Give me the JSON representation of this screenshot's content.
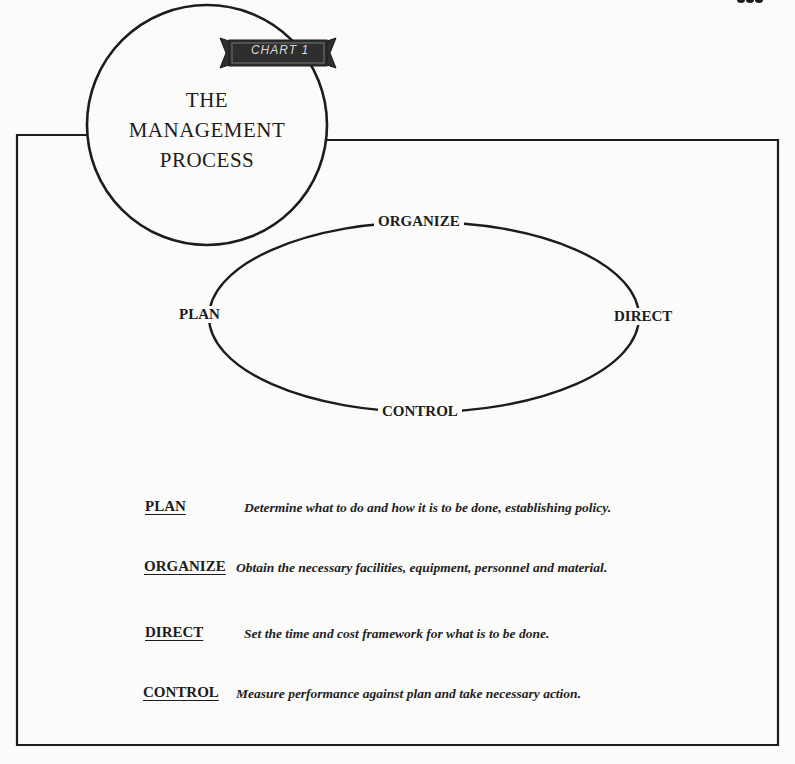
{
  "badge": {
    "label": "CHART 1"
  },
  "title": {
    "lines": [
      "THE",
      "MANAGEMENT",
      "PROCESS"
    ]
  },
  "cycle": {
    "nodes": {
      "top": "ORGANIZE",
      "left": "PLAN",
      "right": "DIRECT",
      "bottom": "CONTROL"
    }
  },
  "definitions": [
    {
      "term": "PLAN",
      "text": "Determine what to do and how it is to be done, establishing policy."
    },
    {
      "term": "ORGANIZE",
      "text": "Obtain the necessary facilities, equipment, personnel and material."
    },
    {
      "term": "DIRECT",
      "text": "Set the time and cost framework for what is to be done."
    },
    {
      "term": "CONTROL",
      "text": "Measure performance against plan and take necessary action."
    }
  ],
  "colors": {
    "ink": "#1c1c1c",
    "paper": "#fbfbf9",
    "badge_fill": "#2e2e2e"
  }
}
